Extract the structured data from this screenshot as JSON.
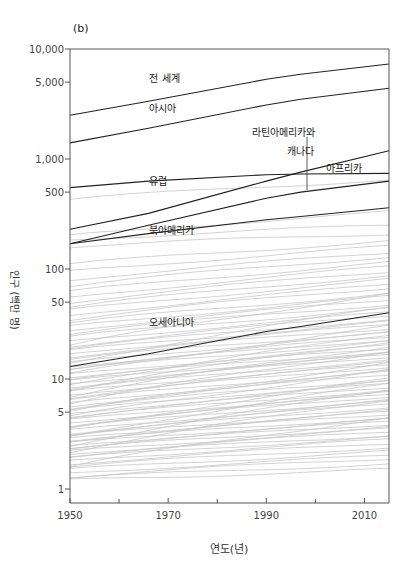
{
  "chart_data": {
    "type": "line",
    "panel_label": "(b)",
    "title": "",
    "xlabel": "연도(년)",
    "ylabel": "인구 (백만 명)",
    "xlim": [
      1950,
      2015
    ],
    "ylim": [
      1,
      10000
    ],
    "yscale": "log",
    "x_ticks": [
      1950,
      1970,
      1990,
      2010
    ],
    "x_minor_ticks": [
      1960,
      1980,
      2000
    ],
    "y_ticks": [
      {
        "value": 10000,
        "label": "10,000"
      },
      {
        "value": 5000,
        "label": "5,000"
      },
      {
        "value": 1000,
        "label": "1,000"
      },
      {
        "value": 500,
        "label": "500"
      },
      {
        "value": 100,
        "label": "100"
      },
      {
        "value": 50,
        "label": "50"
      },
      {
        "value": 10,
        "label": "10"
      },
      {
        "value": 5,
        "label": "5"
      },
      {
        "value": 1,
        "label": "1"
      }
    ],
    "grid": false,
    "legend": "inline labels",
    "x": [
      1950,
      1966,
      1990,
      1997,
      2015
    ],
    "series": [
      {
        "name": "전 세계",
        "values": [
          2500,
          3350,
          5300,
          5900,
          7300
        ],
        "highlight": true
      },
      {
        "name": "아시아",
        "values": [
          1400,
          1900,
          3100,
          3500,
          4400
        ],
        "highlight": true
      },
      {
        "name": "유럽",
        "values": [
          550,
          630,
          720,
          730,
          740
        ],
        "highlight": true
      },
      {
        "name": "라틴아메리카와 캐나다",
        "values": [
          170,
          250,
          440,
          500,
          630
        ],
        "highlight": true
      },
      {
        "name": "아프리카",
        "values": [
          230,
          320,
          630,
          760,
          1190
        ],
        "highlight": true
      },
      {
        "name": "북아메리카",
        "values": [
          170,
          210,
          280,
          300,
          360
        ],
        "highlight": true
      },
      {
        "name": "오세아니아",
        "values": [
          13,
          17,
          27,
          30,
          40
        ],
        "highlight": true
      }
    ],
    "annotations": [
      {
        "text": "전 세계",
        "x": 1967,
        "y": 5600
      },
      {
        "text": "아시아",
        "x": 1967,
        "y": 3000
      },
      {
        "text": "라틴아메리카와",
        "x": 1988,
        "y": 1800
      },
      {
        "text": "캐나다",
        "x": 1995,
        "y": 1200
      },
      {
        "text": "아프리카",
        "x": 2003,
        "y": 850
      },
      {
        "text": "유럽",
        "x": 1967,
        "y": 650
      },
      {
        "text": "북아메리카",
        "x": 1967,
        "y": 230
      },
      {
        "text": "오세아니아",
        "x": 1967,
        "y": 34
      }
    ],
    "background_series_note": "many light-gray country lines between ~1 and ~700 million",
    "background_series": [
      [
        430,
        650
      ],
      [
        200,
        330
      ],
      [
        185,
        250
      ],
      [
        160,
        210
      ],
      [
        110,
        180
      ],
      [
        95,
        160
      ],
      [
        80,
        140
      ],
      [
        70,
        130
      ],
      [
        62,
        115
      ],
      [
        55,
        105
      ],
      [
        50,
        95
      ],
      [
        45,
        88
      ],
      [
        42,
        80
      ],
      [
        38,
        72
      ],
      [
        35,
        68
      ],
      [
        32,
        60
      ],
      [
        30,
        56
      ],
      [
        28,
        52
      ],
      [
        26,
        48
      ],
      [
        24,
        44
      ],
      [
        22,
        40
      ],
      [
        20,
        38
      ],
      [
        19,
        35
      ],
      [
        18,
        33
      ],
      [
        17,
        31
      ],
      [
        16,
        29
      ],
      [
        15,
        27
      ],
      [
        14,
        26
      ],
      [
        13,
        24
      ],
      [
        12.5,
        23
      ],
      [
        12,
        22
      ],
      [
        11,
        20
      ],
      [
        10.5,
        19
      ],
      [
        10,
        18
      ],
      [
        9.5,
        17
      ],
      [
        9,
        16.5
      ],
      [
        8.5,
        16
      ],
      [
        8,
        15
      ],
      [
        7.6,
        14
      ],
      [
        7.2,
        13.5
      ],
      [
        6.8,
        13
      ],
      [
        6.4,
        12
      ],
      [
        6,
        11.5
      ],
      [
        5.7,
        11
      ],
      [
        5.4,
        10
      ],
      [
        5.1,
        9.5
      ],
      [
        4.8,
        9
      ],
      [
        4.6,
        8.5
      ],
      [
        4.4,
        8
      ],
      [
        4.2,
        7.5
      ],
      [
        4,
        7.2
      ],
      [
        3.8,
        7
      ],
      [
        3.6,
        6.5
      ],
      [
        3.4,
        6.2
      ],
      [
        3.2,
        6
      ],
      [
        3.1,
        5.6
      ],
      [
        3,
        5.2
      ],
      [
        2.9,
        5
      ],
      [
        2.8,
        4.8
      ],
      [
        2.7,
        4.5
      ],
      [
        2.6,
        4.3
      ],
      [
        2.5,
        4.1
      ],
      [
        2.4,
        3.9
      ],
      [
        2.3,
        3.7
      ],
      [
        2.2,
        3.5
      ],
      [
        2.1,
        3.3
      ],
      [
        2,
        3.1
      ],
      [
        1.9,
        3
      ],
      [
        1.8,
        2.8
      ],
      [
        1.7,
        2.6
      ],
      [
        1.6,
        2.4
      ],
      [
        1.5,
        2.2
      ],
      [
        1.4,
        2
      ],
      [
        1.3,
        1.9
      ],
      [
        1.25,
        1.7
      ],
      [
        1.2,
        1.5
      ],
      [
        9,
        25
      ],
      [
        7,
        20
      ],
      [
        5,
        14
      ],
      [
        3.5,
        10
      ],
      [
        2.5,
        8
      ],
      [
        6,
        18
      ],
      [
        4.5,
        12
      ],
      [
        3,
        9
      ],
      [
        2.2,
        6.5
      ],
      [
        1.6,
        4.5
      ],
      [
        11,
        30
      ],
      [
        14,
        45
      ],
      [
        8,
        22
      ],
      [
        20,
        60
      ]
    ]
  }
}
